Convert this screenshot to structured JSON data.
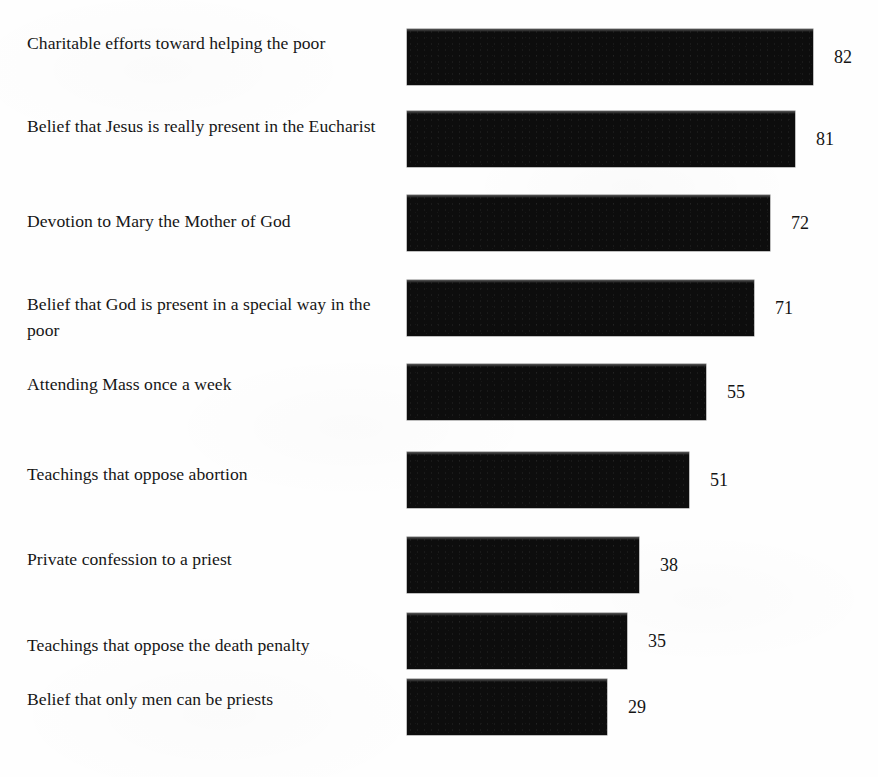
{
  "chart_data": {
    "type": "bar",
    "orientation": "horizontal",
    "title": "",
    "subtitle": "",
    "xlabel": "",
    "ylabel": "",
    "grid": false,
    "legend": null,
    "axis_visible": false,
    "value_label_position": "outside-end",
    "bar_color": "#0d0d0d",
    "background_color": "#fefefe",
    "xlim": [
      0,
      100
    ],
    "categories": [
      "Charitable efforts toward helping the poor",
      "Belief that Jesus is really present in the Eucharist",
      "Devotion to Mary the Mother of God",
      "Belief that God is present in a special way in the poor",
      "Attending Mass once a week",
      "Teachings that oppose abortion",
      "Private confession to a priest",
      "Teachings that oppose the death penalty",
      "Belief that only men can be priests"
    ],
    "values": [
      82,
      81,
      72,
      71,
      55,
      51,
      38,
      35,
      29
    ],
    "value_labels": [
      "82",
      "81",
      "72",
      "71",
      "55",
      "51",
      "38",
      "35",
      "29"
    ]
  },
  "rows": [
    {
      "label": "Charitable efforts toward helping the poor",
      "value": "82",
      "bar_px": 406,
      "bar_top": 29,
      "bar_height": 56,
      "label_top": 30
    },
    {
      "label": "Belief that Jesus is really present in the Eucharist",
      "value": "81",
      "bar_px": 388,
      "bar_top": 111,
      "bar_height": 56,
      "label_top": 113
    },
    {
      "label": "Devotion to Mary the Mother of God",
      "value": "72",
      "bar_px": 363,
      "bar_top": 195,
      "bar_height": 56,
      "label_top": 208
    },
    {
      "label": "Belief that God is present in a special way in the poor",
      "value": "71",
      "bar_px": 347,
      "bar_top": 280,
      "bar_height": 56,
      "label_top": 291
    },
    {
      "label": "Attending Mass once a week",
      "value": "55",
      "bar_px": 299,
      "bar_top": 364,
      "bar_height": 56,
      "label_top": 371
    },
    {
      "label": "Teachings that oppose abortion",
      "value": "51",
      "bar_px": 282,
      "bar_top": 452,
      "bar_height": 56,
      "label_top": 461
    },
    {
      "label": "Private confession to a priest",
      "value": "38",
      "bar_px": 232,
      "bar_top": 537,
      "bar_height": 56,
      "label_top": 546
    },
    {
      "label": "Teachings that oppose the death penalty",
      "value": "35",
      "bar_px": 220,
      "bar_top": 613,
      "bar_height": 56,
      "label_top": 632
    },
    {
      "label": "Belief that only men can be priests",
      "value": "29",
      "bar_px": 200,
      "bar_top": 679,
      "bar_height": 56,
      "label_top": 686
    }
  ]
}
